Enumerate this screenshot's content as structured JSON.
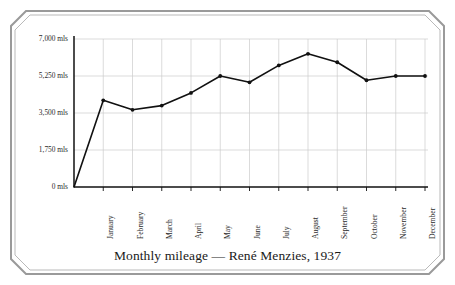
{
  "chart_data": {
    "type": "line",
    "title": "Monthly mileage — René Menzies, 1937",
    "xlabel": "",
    "ylabel": "",
    "ylim": [
      0,
      7000
    ],
    "grid": true,
    "legend_position": "none",
    "unit_suffix": "mls",
    "categories": [
      "January",
      "February",
      "March",
      "April",
      "May",
      "June",
      "July",
      "August",
      "September",
      "October",
      "November",
      "December"
    ],
    "values": [
      4100,
      3650,
      3850,
      4450,
      5250,
      4950,
      5750,
      6300,
      5900,
      5050,
      5250,
      5250
    ],
    "origin_value": 0,
    "y_ticks": [
      0,
      1750,
      3500,
      5250,
      7000
    ],
    "y_tick_labels": [
      "0 mls",
      "1,750 mls",
      "3,500 mls",
      "5,250 mls",
      "7,000 mls"
    ],
    "series": [
      {
        "name": "Monthly mileage",
        "values": [
          4100,
          3650,
          3850,
          4450,
          5250,
          4950,
          5750,
          6300,
          5900,
          5050,
          5250,
          5250
        ]
      }
    ],
    "colors": {
      "line": "#111111",
      "marker": "#111111",
      "grid": "#cccccc",
      "axis": "#111111",
      "text": "#2b2b2b",
      "frame": "#8c8c8c",
      "background": "#ffffff"
    }
  }
}
